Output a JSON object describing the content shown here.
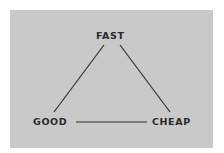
{
  "diagram": {
    "type": "triangle",
    "title": "",
    "colors": {
      "background": "#c9c9c9",
      "line": "#333333",
      "text": "#2a2a2a"
    },
    "nodes": [
      {
        "id": "fast",
        "label": "FAST",
        "position": "top"
      },
      {
        "id": "good",
        "label": "GOOD",
        "position": "bottom-left"
      },
      {
        "id": "cheap",
        "label": "CHEAP",
        "position": "bottom-right"
      }
    ],
    "edges": [
      {
        "from": "fast",
        "to": "good"
      },
      {
        "from": "fast",
        "to": "cheap"
      },
      {
        "from": "good",
        "to": "cheap"
      }
    ]
  }
}
